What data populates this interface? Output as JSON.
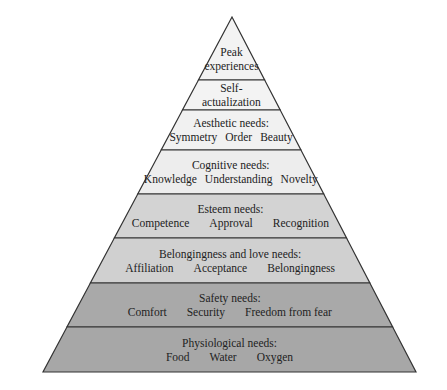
{
  "diagram": {
    "type": "pyramid",
    "apex": {
      "x": 232,
      "y": 17
    },
    "base": {
      "left": 43,
      "right": 416,
      "y": 372
    },
    "tiers": [
      {
        "title": "Peak",
        "title2": "experiences",
        "items": [],
        "y_top": 17,
        "y_bottom": 80,
        "fill": "#f3f3f3"
      },
      {
        "title": "Self-",
        "title2": "actualization",
        "items": [],
        "y_top": 80,
        "y_bottom": 110,
        "fill": "#f3f3f3"
      },
      {
        "title": "Aesthetic needs:",
        "title2": "",
        "items": [
          "Symmetry",
          "Order",
          "Beauty"
        ],
        "y_top": 110,
        "y_bottom": 150,
        "fill": "#f1f1f1"
      },
      {
        "title": "Cognitive needs:",
        "title2": "",
        "items": [
          "Knowledge",
          "Understanding",
          "Novelty"
        ],
        "y_top": 150,
        "y_bottom": 194,
        "fill": "#ededed"
      },
      {
        "title": "Esteem needs:",
        "title2": "",
        "items": [
          "Competence",
          "Approval",
          "Recognition"
        ],
        "y_top": 194,
        "y_bottom": 238,
        "fill": "#d3d3d3"
      },
      {
        "title": "Belongingness and love needs:",
        "title2": "",
        "items": [
          "Affiliation",
          "Acceptance",
          "Belongingness"
        ],
        "y_top": 238,
        "y_bottom": 283,
        "fill": "#d0d0d0"
      },
      {
        "title": "Safety needs:",
        "title2": "",
        "items": [
          "Comfort",
          "Security",
          "Freedom from fear"
        ],
        "y_top": 283,
        "y_bottom": 327,
        "fill": "#a9a9a9"
      },
      {
        "title": "Physiological needs:",
        "title2": "",
        "items": [
          "Food",
          "Water",
          "Oxygen"
        ],
        "y_top": 327,
        "y_bottom": 372,
        "fill": "#a7a7a7"
      }
    ],
    "stroke": "#333333"
  }
}
